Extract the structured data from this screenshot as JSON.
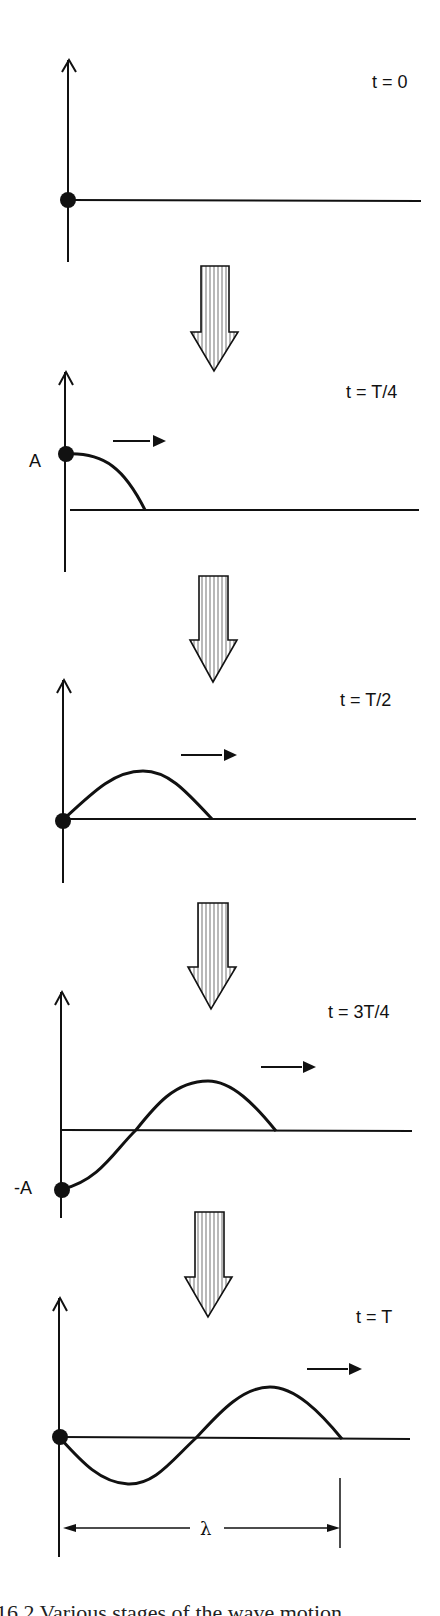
{
  "figure": {
    "panels": [
      {
        "time_label": "t = 0",
        "axis_label": ""
      },
      {
        "time_label": "t = T/4",
        "axis_label": "A"
      },
      {
        "time_label": "t = T/2",
        "axis_label": ""
      },
      {
        "time_label": "t = 3T/4",
        "axis_label": "-A"
      },
      {
        "time_label": "t = T",
        "axis_label": ""
      }
    ],
    "wavelength_label": "λ",
    "caption_partial": "16.2  Various stages of the wave motion"
  },
  "colors": {
    "ink": "#111111",
    "background": "#ffffff"
  }
}
